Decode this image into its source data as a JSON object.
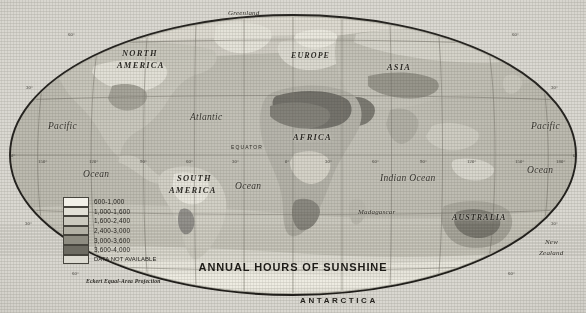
{
  "title": "ANNUAL HOURS OF SUNSHINE",
  "projection_note": "Eckert Equal-Area Projection",
  "legend": {
    "items": [
      {
        "label": "600-1,000",
        "color": "#f2f0e8"
      },
      {
        "label": "1,000-1,600",
        "color": "#e2e0d6"
      },
      {
        "label": "1,600-2,400",
        "color": "#cbc9be"
      },
      {
        "label": "2,400-3,000",
        "color": "#b2b0a4"
      },
      {
        "label": "3,000-3,600",
        "color": "#8e8c81"
      },
      {
        "label": "3,600-4,000",
        "color": "#6d6b62"
      },
      {
        "label": "DATA NOT AVAILABLE",
        "color": "#dcdad1"
      }
    ]
  },
  "map_labels": {
    "continents": [
      {
        "name": "greenland",
        "text": "Greenland",
        "x": 228,
        "y": 10,
        "style": "isl"
      },
      {
        "name": "north-america",
        "text": "NORTH",
        "x": 122,
        "y": 49,
        "style": "cont"
      },
      {
        "name": "north-america2",
        "text": "AMERICA",
        "x": 117,
        "y": 61,
        "style": "cont"
      },
      {
        "name": "europe",
        "text": "EUROPE",
        "x": 291,
        "y": 52,
        "style": "cont2"
      },
      {
        "name": "asia",
        "text": "ASIA",
        "x": 387,
        "y": 63,
        "style": "cont"
      },
      {
        "name": "africa",
        "text": "AFRICA",
        "x": 293,
        "y": 133,
        "style": "cont"
      },
      {
        "name": "south-america",
        "text": "SOUTH",
        "x": 177,
        "y": 174,
        "style": "cont"
      },
      {
        "name": "south-america2",
        "text": "AMERICA",
        "x": 169,
        "y": 186,
        "style": "cont"
      },
      {
        "name": "australia",
        "text": "AUSTRALIA",
        "x": 452,
        "y": 214,
        "style": "cont2"
      },
      {
        "name": "antarctica",
        "text": "ANTARCTICA",
        "x": 300,
        "y": 297,
        "style": "anta"
      }
    ],
    "oceans": [
      {
        "name": "pacific-west",
        "text": "Pacific",
        "x": 48,
        "y": 122,
        "style": "ocean"
      },
      {
        "name": "ocean-west",
        "text": "Ocean",
        "x": 83,
        "y": 170,
        "style": "ocean"
      },
      {
        "name": "atlantic",
        "text": "Atlantic",
        "x": 190,
        "y": 113,
        "style": "ocean"
      },
      {
        "name": "ocean-atl",
        "text": "Ocean",
        "x": 235,
        "y": 182,
        "style": "ocean"
      },
      {
        "name": "indian-ocean",
        "text": "Indian Ocean",
        "x": 380,
        "y": 174,
        "style": "ocean"
      },
      {
        "name": "pacific-east",
        "text": "Pacific",
        "x": 531,
        "y": 122,
        "style": "ocean"
      },
      {
        "name": "ocean-east",
        "text": "Ocean",
        "x": 527,
        "y": 166,
        "style": "ocean"
      }
    ],
    "islands": [
      {
        "name": "madagascar",
        "text": "Madagascar",
        "x": 358,
        "y": 209,
        "style": "isl"
      },
      {
        "name": "new-zealand",
        "text": "New",
        "x": 545,
        "y": 239,
        "style": "isl"
      },
      {
        "name": "new-zealand2",
        "text": "Zealand",
        "x": 539,
        "y": 250,
        "style": "isl"
      }
    ],
    "equator": {
      "text": "EQUATOR",
      "x": 231,
      "y": 145
    }
  },
  "graticule": {
    "longitude_labels": [
      {
        "text": "150°",
        "x": 38,
        "y": 160
      },
      {
        "text": "120°",
        "x": 89,
        "y": 160
      },
      {
        "text": "90°",
        "x": 140,
        "y": 160
      },
      {
        "text": "60°",
        "x": 186,
        "y": 160
      },
      {
        "text": "30°",
        "x": 232,
        "y": 160
      },
      {
        "text": "0°",
        "x": 285,
        "y": 160
      },
      {
        "text": "30°",
        "x": 325,
        "y": 160
      },
      {
        "text": "60°",
        "x": 372,
        "y": 160
      },
      {
        "text": "90°",
        "x": 420,
        "y": 160
      },
      {
        "text": "120°",
        "x": 467,
        "y": 160
      },
      {
        "text": "150°",
        "x": 515,
        "y": 160
      },
      {
        "text": "180°",
        "x": 556,
        "y": 160
      }
    ],
    "latitude_labels": [
      {
        "text": "60°",
        "x": 68,
        "y": 33
      },
      {
        "text": "60°",
        "x": 512,
        "y": 33
      },
      {
        "text": "30°",
        "x": 26,
        "y": 86
      },
      {
        "text": "30°",
        "x": 551,
        "y": 86
      },
      {
        "text": "0°",
        "x": 11,
        "y": 154
      },
      {
        "text": "0°",
        "x": 573,
        "y": 154
      },
      {
        "text": "30°",
        "x": 25,
        "y": 222
      },
      {
        "text": "30°",
        "x": 551,
        "y": 222
      },
      {
        "text": "60°",
        "x": 72,
        "y": 272
      },
      {
        "text": "60°",
        "x": 508,
        "y": 272
      }
    ]
  }
}
